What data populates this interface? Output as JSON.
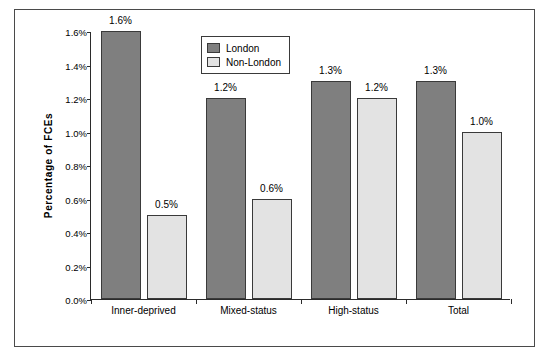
{
  "chart_data": {
    "type": "bar",
    "title": "",
    "xlabel": "",
    "ylabel": "Percentage  of  FCEs",
    "categories": [
      "Inner-deprived",
      "Mixed-status",
      "High-status",
      "Total"
    ],
    "series": [
      {
        "name": "London",
        "color": "#7f7f7f",
        "values": [
          1.6,
          1.2,
          1.3,
          1.3
        ],
        "labels": [
          "1.6%",
          "1.2%",
          "1.3%",
          "1.3%"
        ]
      },
      {
        "name": "Non-London",
        "color": "#e3e3e3",
        "values": [
          0.5,
          0.6,
          1.2,
          1.0
        ],
        "labels": [
          "0.5%",
          "0.6%",
          "1.2%",
          "1.0%"
        ]
      }
    ],
    "ylim": [
      0.0,
      1.6
    ],
    "ytick_labels": [
      "0.0%",
      "0.2%",
      "0.4%",
      "0.6%",
      "0.8%",
      "1.0%",
      "1.2%",
      "1.4%",
      "1.6%"
    ],
    "ytick_values": [
      0.0,
      0.2,
      0.4,
      0.6,
      0.8,
      1.0,
      1.2,
      1.4,
      1.6
    ],
    "grid": false,
    "legend_position": "top-center"
  },
  "legend": {
    "items": [
      {
        "label": "London"
      },
      {
        "label": "Non-London"
      }
    ]
  }
}
